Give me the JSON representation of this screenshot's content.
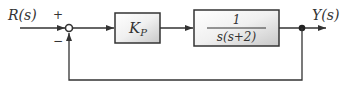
{
  "diagram": {
    "type": "block-diagram",
    "input_label": "R(s)",
    "output_label": "Y(s)",
    "summing_junction": {
      "plus_sign": "+",
      "minus_sign": "−"
    },
    "blocks": [
      {
        "id": "controller",
        "label_main": "K",
        "label_sub": "P"
      },
      {
        "id": "plant",
        "numerator": "1",
        "denominator": "s(s+2)"
      }
    ],
    "feedback": "unity, negative"
  },
  "colors": {
    "line": "#333333",
    "block_fill_light": "#ffffff",
    "block_fill_dark": "#d4d4d4",
    "block_border": "#333333"
  }
}
